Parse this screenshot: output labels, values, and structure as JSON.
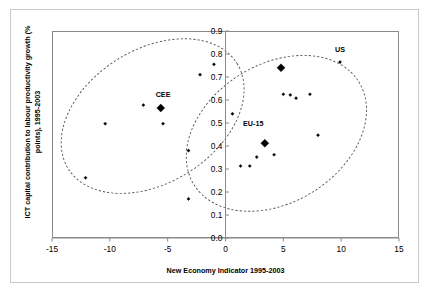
{
  "chart_data": {
    "type": "scatter",
    "title": "",
    "xlabel": "New Economy Indicator 1995-2003",
    "ylabel": "ICT capital contribution to labour productivity growth (% points), 1995-2003",
    "xlim": [
      -15,
      15
    ],
    "ylim": [
      0.0,
      0.9
    ],
    "xticks": [
      -15,
      -10,
      -5,
      0,
      5,
      10,
      15
    ],
    "xtick_labels": [
      "-15",
      "-10",
      "-5",
      "0",
      "5",
      "10",
      "15"
    ],
    "yticks": [
      0.0,
      0.1,
      0.2,
      0.3,
      0.4,
      0.5,
      0.6,
      0.7,
      0.8,
      0.9
    ],
    "ytick_labels": [
      "0.0",
      "0.1",
      "0.2",
      "0.3",
      "0.4",
      "0.5",
      "0.6",
      "0.7",
      "0.8",
      "0.9"
    ],
    "grid": false,
    "legend": "none",
    "y_axis_position": "at-x-zero",
    "marker": "diamond",
    "marker_color": "#000000",
    "series": [
      {
        "name": "countries",
        "marker_size": 3.2,
        "points": [
          {
            "x": -12.1,
            "y": 0.262
          },
          {
            "x": -10.4,
            "y": 0.497
          },
          {
            "x": -7.1,
            "y": 0.578
          },
          {
            "x": -5.4,
            "y": 0.497
          },
          {
            "x": -3.2,
            "y": 0.38
          },
          {
            "x": -3.2,
            "y": 0.17
          },
          {
            "x": -2.2,
            "y": 0.71
          },
          {
            "x": -1.0,
            "y": 0.755
          },
          {
            "x": 0.6,
            "y": 0.54
          },
          {
            "x": 1.3,
            "y": 0.313
          },
          {
            "x": 2.1,
            "y": 0.313
          },
          {
            "x": 2.7,
            "y": 0.352
          },
          {
            "x": 4.2,
            "y": 0.362
          },
          {
            "x": 5.0,
            "y": 0.625
          },
          {
            "x": 5.6,
            "y": 0.622
          },
          {
            "x": 6.1,
            "y": 0.608
          },
          {
            "x": 7.3,
            "y": 0.625
          },
          {
            "x": 8.0,
            "y": 0.447
          },
          {
            "x": 9.9,
            "y": 0.765
          }
        ]
      },
      {
        "name": "aggregates",
        "marker_size": 8.0,
        "points": [
          {
            "x": -5.6,
            "y": 0.565,
            "label": "CEE"
          },
          {
            "x": 3.4,
            "y": 0.412,
            "label": "EU-15"
          },
          {
            "x": 4.8,
            "y": 0.74,
            "label": ""
          }
        ]
      }
    ],
    "annotations": [
      {
        "text": "CEE",
        "x": -5.4,
        "y": 0.605
      },
      {
        "text": "EU-15",
        "x": 2.4,
        "y": 0.48
      },
      {
        "text": "US",
        "x": 9.9,
        "y": 0.8
      }
    ],
    "ellipses": [
      {
        "name": "cee-cluster",
        "cx": -6.3,
        "cy": 0.53,
        "rx": 8.6,
        "ry": 2.9,
        "rotation": -32,
        "style": "dashed"
      },
      {
        "name": "eu-us-cluster",
        "cx": 4.4,
        "cy": 0.455,
        "rx": 8.4,
        "ry": 3.0,
        "rotation": -32,
        "style": "dashed"
      }
    ]
  }
}
